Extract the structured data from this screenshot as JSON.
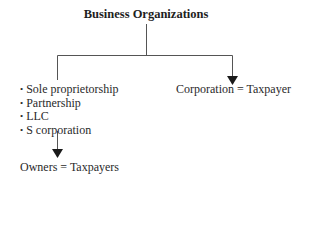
{
  "diagram": {
    "title": "Business Organizations",
    "left_branch": {
      "items": [
        "Sole proprietorship",
        "Partnership",
        "LLC",
        "S corporation"
      ],
      "result": "Owners = Taxpayers"
    },
    "right_branch": {
      "result": "Corporation = Taxpayer"
    },
    "colors": {
      "line": "#555555",
      "arrow": "#1a1a1a",
      "text": "#2a2a2a"
    }
  }
}
